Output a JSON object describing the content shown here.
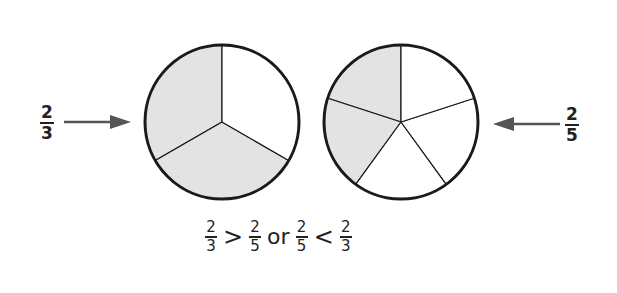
{
  "diagram": {
    "left": {
      "label": {
        "numerator": "2",
        "denominator": "3"
      },
      "parts": 3,
      "shaded": 2,
      "arrow_direction": "right"
    },
    "right": {
      "label": {
        "numerator": "2",
        "denominator": "5"
      },
      "parts": 5,
      "shaded": 2,
      "arrow_direction": "left"
    },
    "comparison": {
      "a": {
        "numerator": "2",
        "denominator": "3"
      },
      "op1": ">",
      "b": {
        "numerator": "2",
        "denominator": "5"
      },
      "word": "or",
      "c": {
        "numerator": "2",
        "denominator": "5"
      },
      "op2": "<",
      "d": {
        "numerator": "2",
        "denominator": "3"
      }
    },
    "colors": {
      "shade": "#e3e3e3",
      "stroke": "#1a1a1a",
      "arrow": "#555555"
    }
  }
}
